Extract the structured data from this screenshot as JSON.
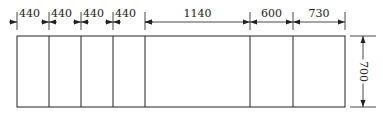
{
  "diagram": {
    "type": "dimensioned-panel-layout",
    "stroke_color": "#222222",
    "background": "#ffffff",
    "horizontal_dimensions": [
      {
        "label": "440",
        "x1": 17,
        "x2": 49
      },
      {
        "label": "440",
        "x1": 49,
        "x2": 81
      },
      {
        "label": "440",
        "x1": 81,
        "x2": 113
      },
      {
        "label": "440",
        "x1": 113,
        "x2": 145
      },
      {
        "label": "1140",
        "x1": 145,
        "x2": 250
      },
      {
        "label": "600",
        "x1": 250,
        "x2": 293
      },
      {
        "label": "730",
        "x1": 293,
        "x2": 345
      }
    ],
    "vertical_dimension": {
      "label": "700",
      "y1": 36,
      "y2": 107,
      "x": 363
    },
    "rectangle": {
      "x": 17,
      "y": 36,
      "width": 328,
      "height": 71
    },
    "dividers_x": [
      49,
      81,
      113,
      145,
      250,
      293
    ]
  }
}
